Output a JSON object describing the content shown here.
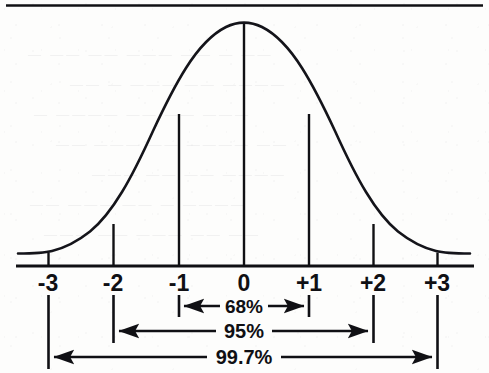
{
  "figure": {
    "top_rule": true,
    "background_color": "#fdfdfc",
    "ink_color": "#101014"
  },
  "axis": {
    "name": "standard-deviation-axis",
    "baseline_y": 266,
    "ticks": [
      {
        "label": "-3",
        "sigma": -3,
        "x": 48
      },
      {
        "label": "-2",
        "sigma": -2,
        "x": 113
      },
      {
        "label": "-1",
        "sigma": -1,
        "x": 179
      },
      {
        "label": "0",
        "sigma": 0,
        "x": 244
      },
      {
        "label": "+1",
        "sigma": 1,
        "x": 309
      },
      {
        "label": "+2",
        "sigma": 2,
        "x": 373
      },
      {
        "label": "+3",
        "sigma": 3,
        "x": 437
      }
    ],
    "label_y": 272
  },
  "brackets": [
    {
      "name": "bracket-68",
      "label": "68%",
      "from_label": "-1",
      "to_label": "+1",
      "from_x": 179,
      "to_x": 309,
      "y": 306,
      "cap_top": 295,
      "cap_bottom": 317
    },
    {
      "name": "bracket-95",
      "label": "95%",
      "from_label": "-2",
      "to_label": "+2",
      "from_x": 113,
      "to_x": 373,
      "y": 331,
      "cap_top": 295,
      "cap_bottom": 343
    },
    {
      "name": "bracket-997",
      "label": "99.7%",
      "from_label": "-3",
      "to_label": "+3",
      "from_x": 48,
      "to_x": 437,
      "y": 357,
      "cap_top": 295,
      "cap_bottom": 369
    }
  ],
  "chart_data": {
    "type": "line",
    "xlabel": "",
    "ylabel": "",
    "xlim": [
      -3.45,
      3.45
    ],
    "ylim": [
      0,
      1
    ],
    "grid": false,
    "legend_position": "none",
    "curve": "standard normal probability density, peak at 0",
    "categories": [
      "-3",
      "-2",
      "-1",
      "0",
      "+1",
      "+2",
      "+3"
    ],
    "x": [
      -3,
      -2,
      -1,
      0,
      1,
      2,
      3
    ],
    "values": [
      0.0111,
      0.1353,
      0.6065,
      1.0,
      0.6065,
      0.1353,
      0.0111
    ],
    "annotations": [
      {
        "text": "68%",
        "from_sigma": -1,
        "to_sigma": 1,
        "meaning": "proportion within 1 standard deviation"
      },
      {
        "text": "95%",
        "from_sigma": -2,
        "to_sigma": 2,
        "meaning": "proportion within 2 standard deviations"
      },
      {
        "text": "99.7%",
        "from_sigma": -3,
        "to_sigma": 3,
        "meaning": "proportion within 3 standard deviations"
      }
    ],
    "vertical_lines_at_sigma": [
      -2,
      -1,
      0,
      1,
      2
    ]
  },
  "ghost_text": {
    "note": "faint show-through from reverse of scanned page",
    "lines": [
      {
        "text": "— —— —— ———  —— — ——",
        "x": 28,
        "y": 46
      },
      {
        "text": "—— — ——— —— ————",
        "x": 70,
        "y": 76
      },
      {
        "text": "— ———— —— —— ———",
        "x": 34,
        "y": 106
      },
      {
        "text": "—— ——— —— ———— ——",
        "x": 56,
        "y": 136
      },
      {
        "text": "——— —— —— ————",
        "x": 92,
        "y": 166
      },
      {
        "text": "—— ——— —— — ————",
        "x": 30,
        "y": 196
      },
      {
        "text": "——— —— ——— —— ——",
        "x": 44,
        "y": 226
      }
    ]
  }
}
